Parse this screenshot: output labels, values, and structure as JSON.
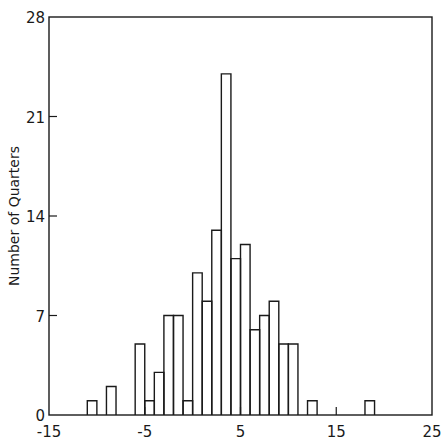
{
  "chart_data": {
    "type": "bar",
    "subtype": "histogram",
    "title": "",
    "xlabel": "",
    "ylabel": "Number of Quarters",
    "xlim": [
      -15,
      25
    ],
    "ylim": [
      0,
      28
    ],
    "xticks": [
      -15,
      -5,
      5,
      15,
      25
    ],
    "xtick_labels": [
      "-15",
      "-5",
      "5",
      "15",
      "25"
    ],
    "yticks": [
      0,
      7,
      14,
      21,
      28
    ],
    "ytick_labels": [
      "0",
      "7",
      "14",
      "21",
      "28"
    ],
    "grid": false,
    "legend": null,
    "bin_width": 1,
    "bins": [
      {
        "start": -11,
        "end": -10,
        "count": 1
      },
      {
        "start": -9,
        "end": -8,
        "count": 2
      },
      {
        "start": -6,
        "end": -5,
        "count": 5
      },
      {
        "start": -5,
        "end": -4,
        "count": 1
      },
      {
        "start": -4,
        "end": -3,
        "count": 3
      },
      {
        "start": -3,
        "end": -2,
        "count": 7
      },
      {
        "start": -2,
        "end": -1,
        "count": 7
      },
      {
        "start": -1,
        "end": 0,
        "count": 1
      },
      {
        "start": 0,
        "end": 1,
        "count": 10
      },
      {
        "start": 1,
        "end": 2,
        "count": 8
      },
      {
        "start": 2,
        "end": 3,
        "count": 13
      },
      {
        "start": 3,
        "end": 4,
        "count": 24
      },
      {
        "start": 4,
        "end": 5,
        "count": 11
      },
      {
        "start": 5,
        "end": 6,
        "count": 12
      },
      {
        "start": 6,
        "end": 7,
        "count": 6
      },
      {
        "start": 7,
        "end": 8,
        "count": 7
      },
      {
        "start": 8,
        "end": 9,
        "count": 8
      },
      {
        "start": 9,
        "end": 10,
        "count": 5
      },
      {
        "start": 10,
        "end": 11,
        "count": 5
      },
      {
        "start": 12,
        "end": 13,
        "count": 1
      },
      {
        "start": 18,
        "end": 19,
        "count": 1
      }
    ],
    "line_color": "#1a1a1a",
    "background": "#ffffff"
  }
}
